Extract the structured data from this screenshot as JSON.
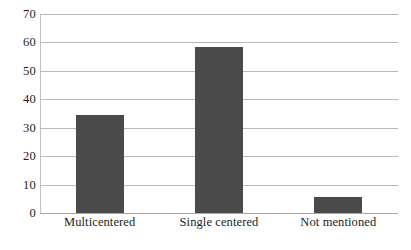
{
  "chart_data": {
    "type": "bar",
    "title": "",
    "subtitle": "",
    "xlabel": "",
    "ylabel": "",
    "categories": [
      "Multicentered",
      "Single centered",
      "Not mentioned"
    ],
    "values": [
      34.5,
      58.5,
      5.5
    ],
    "ylim": [
      0,
      70
    ],
    "ytick_step": 10,
    "yticks": [
      0,
      10,
      20,
      30,
      40,
      50,
      60,
      70
    ],
    "ytick_labels": [
      "0",
      "10",
      "20",
      "30",
      "40",
      "50",
      "60",
      "70"
    ],
    "grid": true,
    "grid_axis": "y",
    "legend": false,
    "legend_position": "none",
    "annotations": [],
    "series": [
      {
        "name": "",
        "values": [
          34.5,
          58.5,
          5.5
        ]
      }
    ]
  },
  "style": {
    "bar_color": "#4a4a4a",
    "gridline_color": "#b9b9b9",
    "axis_color": "#a8a8a8",
    "background": "#ffffff",
    "text_color": "#1c1c1c"
  }
}
